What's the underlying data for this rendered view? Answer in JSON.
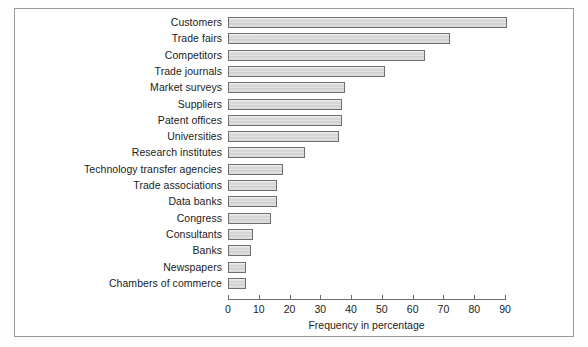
{
  "chart_data": {
    "type": "bar",
    "orientation": "horizontal",
    "title": "",
    "xlabel": "Frequency in percentage",
    "ylabel": "",
    "xlim": [
      0,
      90
    ],
    "xticks": [
      0,
      10,
      20,
      30,
      40,
      50,
      60,
      70,
      80,
      90
    ],
    "grid": false,
    "legend": null,
    "categories": [
      "Customers",
      "Trade fairs",
      "Competitors",
      "Trade journals",
      "Market surveys",
      "Suppliers",
      "Patent offices",
      "Universities",
      "Research institutes",
      "Technology transfer agencies",
      "Trade associations",
      "Data banks",
      "Congress",
      "Consultants",
      "Banks",
      "Newspapers",
      "Chambers of commerce"
    ],
    "values": [
      90.5,
      72,
      64,
      51,
      38,
      37,
      37,
      36,
      25,
      18,
      16,
      16,
      14,
      8,
      7.5,
      6,
      6
    ]
  },
  "axis": {
    "title": "Frequency in percentage",
    "ticks": [
      "0",
      "10",
      "20",
      "30",
      "40",
      "50",
      "60",
      "70",
      "80",
      "90"
    ]
  },
  "colors": {
    "bar_fill": "#d2d2d2",
    "bar_border": "#6f6f6f",
    "frame_border": "#9a9a9a",
    "text": "#1b1b1b",
    "background": "#ffffff"
  }
}
